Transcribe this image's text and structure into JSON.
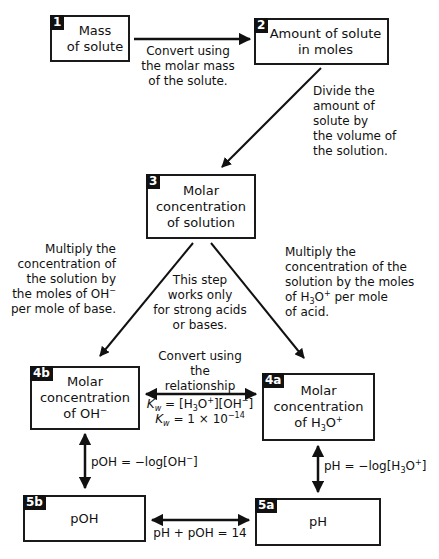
{
  "nodes": [
    {
      "id": "1",
      "badge": "1",
      "text": [
        "Mass",
        "of solute"
      ]
    },
    {
      "id": "2",
      "badge": "2",
      "text": [
        "Amount of solute",
        "in moles"
      ]
    },
    {
      "id": "3",
      "badge": "3",
      "text": [
        "Molar",
        "concentration",
        "of solution"
      ]
    },
    {
      "id": "4b",
      "badge": "4b",
      "text": [
        "Molar",
        "concentration",
        "of OH"
      ],
      "superscript": "−"
    },
    {
      "id": "4a",
      "badge": "4a",
      "text": [
        "Molar",
        "concentration",
        "of H"
      ],
      "subscript": "3",
      "tail": "O",
      "superscript": "+"
    },
    {
      "id": "5b",
      "badge": "5b",
      "text": [
        "pOH"
      ]
    },
    {
      "id": "5a",
      "badge": "5a",
      "text": [
        "pH"
      ]
    }
  ],
  "edges": [
    {
      "from": "1",
      "to": "2",
      "label": [
        "Convert using",
        "the molar mass",
        "of the solute."
      ]
    },
    {
      "from": "2",
      "to": "3",
      "label": [
        "Divide the",
        "amount of",
        "solute by",
        "the volume of",
        "the solution."
      ]
    },
    {
      "from": "3",
      "to": "4b",
      "label": [
        "Multiply the",
        "concentration of",
        "the solution by",
        "the moles of OH−",
        "per mole of base."
      ]
    },
    {
      "from": "3",
      "to": "4a",
      "label": [
        "Multiply the",
        "concentration of the",
        "solution by the moles",
        "of H₃O⁺ per mole",
        "of acid."
      ]
    },
    {
      "from": "3",
      "to": "4a/4b",
      "note": [
        "This step",
        "works only",
        "for strong acids",
        "or bases."
      ]
    },
    {
      "from": "4a",
      "to": "4b",
      "bidirectional": true,
      "label": [
        "Convert using",
        "the",
        "relationship"
      ],
      "equations": [
        "K_w = [H3O+][OH−]",
        "K_w = 1 × 10^−14"
      ]
    },
    {
      "from": "4b",
      "to": "5b",
      "bidirectional": true,
      "label": "pOH = −log[OH−]"
    },
    {
      "from": "4a",
      "to": "5a",
      "bidirectional": true,
      "label": "pH = −log[H3O+]"
    },
    {
      "from": "5b",
      "to": "5a",
      "bidirectional": true,
      "label": "pH + pOH = 14"
    }
  ],
  "text": {
    "b1_l1": "Mass",
    "b1_l2": "of solute",
    "b2_l1": "Amount of solute",
    "b2_l2": "in moles",
    "b3_l1": "Molar",
    "b3_l2": "concentration",
    "b3_l3": "of solution",
    "b4b_l1": "Molar",
    "b4b_l2": "concentration",
    "b4b_l3": "of OH",
    "b4a_l1": "Molar",
    "b4a_l2": "concentration",
    "b4a_l3a": "of H",
    "b4a_l3b": "O",
    "b5b": "pOH",
    "b5a": "pH",
    "badge1": "1",
    "badge2": "2",
    "badge3": "3",
    "badge4b": "4b",
    "badge4a": "4a",
    "badge5b": "5b",
    "badge5a": "5a",
    "e12_l1": "Convert using",
    "e12_l2": "the molar mass",
    "e12_l3": "of the solute.",
    "e23_l1": "Divide the",
    "e23_l2": "amount of",
    "e23_l3": "solute by",
    "e23_l4": "the volume of",
    "e23_l5": "the solution.",
    "e34b_l1": "Multiply the",
    "e34b_l2": "concentration of",
    "e34b_l3": "the solution by",
    "e34b_l4": "the moles of OH",
    "e34b_l5": "per mole of base.",
    "e34a_l1": "Multiply the",
    "e34a_l2": "concentration of the",
    "e34a_l3": "solution by the moles",
    "e34a_l4a": "of H",
    "e34a_l4b": "O",
    "e34a_l4c": " per mole",
    "e34a_l5": "of acid.",
    "note_l1": "This step",
    "note_l2": "works only",
    "note_l3": "for strong acids",
    "note_l4": "or bases.",
    "kw_l1": "Convert using",
    "kw_l2": "the",
    "kw_l3": "relationship",
    "kw_eq1_k": "K",
    "kw_eq1_w": "w",
    "kw_eq1_a": " = [H",
    "kw_eq1_b": "O",
    "kw_eq1_c": "][OH",
    "kw_eq1_d": "]",
    "kw_eq2_k": "K",
    "kw_eq2_w": "w",
    "kw_eq2_a": " = 1 × 10",
    "kw_eq2_exp": "−14",
    "poh_a": "pOH = −log[OH",
    "poh_b": "]",
    "ph_a": "pH = −log[H",
    "ph_b": "O",
    "ph_c": "]",
    "sum": "pH + pOH = 14",
    "sub3": "3",
    "supPlus": "+",
    "supMinus": "−"
  },
  "colors": {
    "line": "#111111",
    "badge_bg": "#111111",
    "badge_fg": "#ffffff",
    "background": "#ffffff"
  }
}
